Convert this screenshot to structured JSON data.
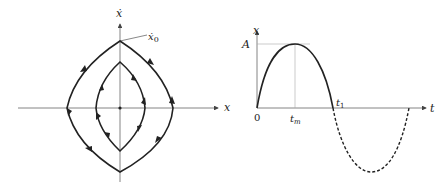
{
  "phase_portrait": {
    "x_axis_label": "x",
    "y_axis_label": "ẋ",
    "initial_point_label": "ẋ",
    "initial_point_subscript": "0",
    "curves": [
      "outer closed trajectory",
      "inner closed trajectory"
    ],
    "flow_direction": "clockwise"
  },
  "time_response": {
    "y_axis_label": "x",
    "x_axis_label": "t",
    "amplitude_label": "A",
    "origin_label": "0",
    "peak_time_label": "t",
    "peak_time_subscript": "m",
    "crossing_time_label": "t",
    "crossing_time_subscript": "1",
    "solid_segment": "0 to t1",
    "dashed_segment": "t1 to end of period"
  },
  "colors": {
    "curve": "#222222",
    "axis": "#666666",
    "guide": "#aaaaaa"
  }
}
